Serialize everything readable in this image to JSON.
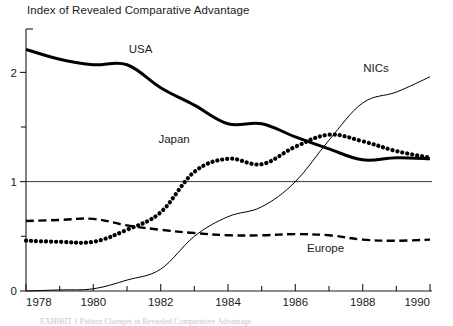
{
  "chart_data": {
    "type": "line",
    "title": "Index of Revealed Comparative Advantage",
    "xlabel": "",
    "ylabel": "",
    "x": [
      1978,
      1979,
      1980,
      1981,
      1982,
      1983,
      1984,
      1985,
      1986,
      1987,
      1988,
      1989,
      1990
    ],
    "xlim": [
      1978,
      1990
    ],
    "ylim": [
      0,
      2.4
    ],
    "yticks": [
      0,
      1,
      2
    ],
    "ytick_labels": [
      "0",
      "1",
      "2"
    ],
    "yminor_ticks": [
      0.5,
      1.5
    ],
    "xticks": [
      1978,
      1979,
      1980,
      1981,
      1982,
      1983,
      1984,
      1985,
      1986,
      1987,
      1988,
      1989,
      1990
    ],
    "xtick_labels": [
      "1978",
      "",
      "1980",
      "",
      "1982",
      "",
      "1984",
      "",
      "1986",
      "",
      "1988",
      "",
      "1990"
    ],
    "grid": false,
    "reference_lines": [
      {
        "y": 1,
        "style": "solid",
        "width": 1
      }
    ],
    "legend": "inline-labels",
    "series": [
      {
        "name": "USA",
        "style": "thick-solid",
        "label_x": 1981.4,
        "label_y": 2.18,
        "values": [
          2.21,
          2.12,
          2.07,
          2.07,
          1.86,
          1.7,
          1.53,
          1.53,
          1.41,
          1.3,
          1.2,
          1.22,
          1.21
        ]
      },
      {
        "name": "Japan",
        "style": "dotted",
        "label_x": 1982.4,
        "label_y": 1.35,
        "values": [
          0.46,
          0.45,
          0.45,
          0.56,
          0.72,
          1.09,
          1.21,
          1.16,
          1.32,
          1.43,
          1.37,
          1.28,
          1.22
        ]
      },
      {
        "name": "Europe",
        "style": "dashed",
        "label_x": 1986.9,
        "label_y": 0.36,
        "values": [
          0.64,
          0.65,
          0.66,
          0.6,
          0.56,
          0.53,
          0.51,
          0.51,
          0.52,
          0.51,
          0.47,
          0.46,
          0.47
        ]
      },
      {
        "name": "NICs",
        "style": "thin-solid",
        "label_x": 1988.4,
        "label_y": 2.0,
        "values": [
          0.0,
          0.01,
          0.02,
          0.1,
          0.2,
          0.5,
          0.68,
          0.77,
          1.0,
          1.38,
          1.72,
          1.82,
          1.96
        ]
      }
    ]
  },
  "caption": {
    "text": "EXHIBIT 1  Pattern Changes in Revealed Comparative Advantage"
  },
  "axis": {
    "y_label_2": "2",
    "y_label_1": "1",
    "y_label_0": "0"
  }
}
